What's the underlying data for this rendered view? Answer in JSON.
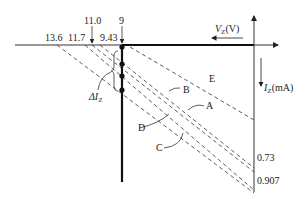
{
  "diagram": {
    "axes": {
      "voltage_axis_label": "V",
      "voltage_axis_sub": "Z",
      "voltage_axis_unit": "(V)",
      "current_axis_label": "I",
      "current_axis_sub": "Z",
      "current_axis_unit": "(mA)"
    },
    "voltage_ticks": {
      "t1": "13.6",
      "t2": "11.7",
      "t3": "11.0",
      "t4": "9.43",
      "t5": "9"
    },
    "current_ticks": {
      "c1": "0.73",
      "c2": "0.907"
    },
    "load_lines": {
      "A": "A",
      "B": "B",
      "C": "C",
      "D": "D",
      "E": "E"
    },
    "annotation": {
      "delta": "ΔI",
      "delta_sub": "Z"
    }
  }
}
